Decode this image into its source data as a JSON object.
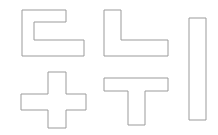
{
  "canvas": {
    "width": 218,
    "height": 135,
    "background_color": "#ffffff",
    "stroke_color": "#9b9b9b",
    "fill_color": "#ffffff",
    "stroke_width": 1,
    "description": "Five outlined polygon shapes arranged on a plain white background"
  },
  "shapes": [
    {
      "id": "shape-c-bracket",
      "name": "c-bracket-shape",
      "label": "C",
      "row": 1,
      "column": 1,
      "bbox": {
        "x": 22,
        "y": 10,
        "width": 62,
        "height": 47
      },
      "points": "22,10 66,10 66,22 34,22 34,40 84,40 84,56 22,56"
    },
    {
      "id": "shape-l",
      "name": "l-shape",
      "label": "L",
      "row": 1,
      "column": 2,
      "bbox": {
        "x": 104,
        "y": 10,
        "width": 64,
        "height": 47
      },
      "points": "104,10 121,10 121,40 168,40 168,56 104,56"
    },
    {
      "id": "shape-vertical-bar",
      "name": "vertical-bar-shape",
      "label": "I",
      "row": 1,
      "column": 3,
      "bbox": {
        "x": 189,
        "y": 18,
        "width": 17,
        "height": 102
      },
      "points": "189,18 206,18 206,120 189,120"
    },
    {
      "id": "shape-plus",
      "name": "plus-cross-shape",
      "label": "+",
      "row": 2,
      "column": 1,
      "bbox": {
        "x": 21,
        "y": 72,
        "width": 65,
        "height": 56
      },
      "points": "48,72 66,72 66,94 86,94 86,110 66,110 66,128 48,128 48,110 21,110 21,94 48,94"
    },
    {
      "id": "shape-t",
      "name": "t-shape",
      "label": "T",
      "row": 2,
      "column": 2,
      "bbox": {
        "x": 104,
        "y": 78,
        "width": 64,
        "height": 47
      },
      "points": "104,78 168,78 168,91 145,91 145,125 128,125 128,91 104,91"
    }
  ]
}
